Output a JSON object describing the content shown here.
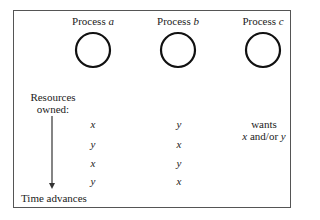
{
  "processes": [
    {
      "prefix": "Process ",
      "name": "a"
    },
    {
      "prefix": "Process ",
      "name": "b"
    },
    {
      "prefix": "Process ",
      "name": "c"
    }
  ],
  "labels": {
    "resources_line1": "Resources",
    "resources_line2": "owned:",
    "time_advances": "Time advances",
    "wants_line1": "wants",
    "wants_x": "x",
    "wants_mid": " and/or ",
    "wants_y": "y"
  },
  "rows": [
    {
      "a": "x",
      "b": "y"
    },
    {
      "a": "y",
      "b": "x"
    },
    {
      "a": "x",
      "b": "y"
    },
    {
      "a": "y",
      "b": "x"
    }
  ]
}
